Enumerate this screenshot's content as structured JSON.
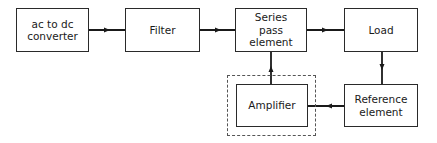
{
  "diagram": {
    "blocks": {
      "converter": {
        "label": "ac to dc\nconverter"
      },
      "filter": {
        "label": "Filter"
      },
      "series_pass": {
        "label": "Series\npass\nelement"
      },
      "load": {
        "label": "Load"
      },
      "amplifier": {
        "label": "Amplifier"
      },
      "reference": {
        "label": "Reference\nelement"
      }
    },
    "connections": [
      {
        "from": "ac to dc converter",
        "to": "Filter"
      },
      {
        "from": "Filter",
        "to": "Series pass element"
      },
      {
        "from": "Series pass element",
        "to": "Load"
      },
      {
        "from": "Load",
        "to": "Reference element"
      },
      {
        "from": "Reference element",
        "to": "Amplifier"
      },
      {
        "from": "Amplifier",
        "to": "Series pass element"
      }
    ],
    "dashed_group": "Amplifier"
  }
}
